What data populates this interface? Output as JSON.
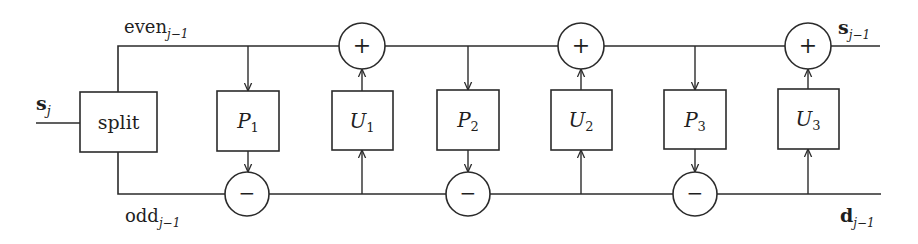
{
  "diagram": {
    "input": {
      "label": "s",
      "subscript": "j"
    },
    "split": {
      "label": "split"
    },
    "even": {
      "label": "even",
      "subscript": "j−1"
    },
    "odd": {
      "label": "odd",
      "subscript": "j−1"
    },
    "output_s": {
      "label": "s",
      "subscript": "j−1"
    },
    "output_d": {
      "label": "d",
      "subscript": "j−1"
    },
    "predict": [
      {
        "label": "P",
        "subscript": "1"
      },
      {
        "label": "P",
        "subscript": "2"
      },
      {
        "label": "P",
        "subscript": "3"
      }
    ],
    "update": [
      {
        "label": "U",
        "subscript": "1"
      },
      {
        "label": "U",
        "subscript": "2"
      },
      {
        "label": "U",
        "subscript": "3"
      }
    ],
    "subtract_nodes": [
      {
        "symbol": "−"
      },
      {
        "symbol": "−"
      },
      {
        "symbol": "−"
      }
    ],
    "add_nodes": [
      {
        "symbol": "+"
      },
      {
        "symbol": "+"
      },
      {
        "symbol": "+"
      }
    ]
  },
  "colors": {
    "line": "#2b2b2b",
    "background": "#ffffff"
  }
}
